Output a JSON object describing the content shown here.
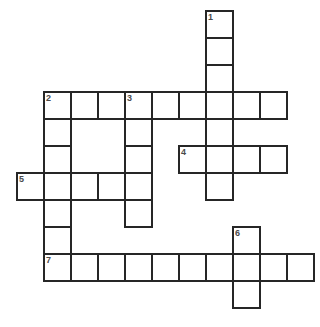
{
  "puzzle": {
    "type": "crossword-grid",
    "title": "Crossword Puzzle Grid",
    "background_color": "#ffffff",
    "cell_border_color": "#262626",
    "cell_fill_color": "#ffffff",
    "number_color": "#4a4a4a",
    "cell_size_px": 27,
    "border_width_px": 2,
    "grid_origin": {
      "x": 16,
      "y": 10
    },
    "grid_columns": 11,
    "grid_rows": 11,
    "clue_numbers_visible": [
      "1",
      "2",
      "3",
      "4",
      "5",
      "6",
      "7"
    ],
    "entries": [
      {
        "number": "1",
        "direction": "down",
        "start_col": 7,
        "start_row": 0,
        "length": 7
      },
      {
        "number": "2",
        "direction": "across",
        "start_col": 1,
        "start_row": 3,
        "length": 9
      },
      {
        "number": "2",
        "direction": "down",
        "start_col": 1,
        "start_row": 3,
        "length": 7
      },
      {
        "number": "3",
        "direction": "down",
        "start_col": 4,
        "start_row": 3,
        "length": 5
      },
      {
        "number": "4",
        "direction": "across",
        "start_col": 6,
        "start_row": 5,
        "length": 4
      },
      {
        "number": "5",
        "direction": "across",
        "start_col": 0,
        "start_row": 6,
        "length": 4
      },
      {
        "number": "6",
        "direction": "down",
        "start_col": 8,
        "start_row": 8,
        "length": 3
      },
      {
        "number": "7",
        "direction": "across",
        "start_col": 1,
        "start_row": 9,
        "length": 10
      }
    ],
    "cells": [
      {
        "col": 7,
        "row": 0,
        "number": "1",
        "letter": ""
      },
      {
        "col": 7,
        "row": 1,
        "number": "",
        "letter": ""
      },
      {
        "col": 7,
        "row": 2,
        "number": "",
        "letter": ""
      },
      {
        "col": 1,
        "row": 3,
        "number": "2",
        "letter": ""
      },
      {
        "col": 2,
        "row": 3,
        "number": "",
        "letter": ""
      },
      {
        "col": 3,
        "row": 3,
        "number": "",
        "letter": ""
      },
      {
        "col": 4,
        "row": 3,
        "number": "3",
        "letter": ""
      },
      {
        "col": 5,
        "row": 3,
        "number": "",
        "letter": ""
      },
      {
        "col": 6,
        "row": 3,
        "number": "",
        "letter": ""
      },
      {
        "col": 7,
        "row": 3,
        "number": "",
        "letter": ""
      },
      {
        "col": 8,
        "row": 3,
        "number": "",
        "letter": ""
      },
      {
        "col": 9,
        "row": 3,
        "number": "",
        "letter": ""
      },
      {
        "col": 1,
        "row": 4,
        "number": "",
        "letter": ""
      },
      {
        "col": 4,
        "row": 4,
        "number": "",
        "letter": ""
      },
      {
        "col": 7,
        "row": 4,
        "number": "",
        "letter": ""
      },
      {
        "col": 1,
        "row": 5,
        "number": "",
        "letter": ""
      },
      {
        "col": 4,
        "row": 5,
        "number": "",
        "letter": ""
      },
      {
        "col": 6,
        "row": 5,
        "number": "4",
        "letter": ""
      },
      {
        "col": 7,
        "row": 5,
        "number": "",
        "letter": ""
      },
      {
        "col": 8,
        "row": 5,
        "number": "",
        "letter": ""
      },
      {
        "col": 9,
        "row": 5,
        "number": "",
        "letter": ""
      },
      {
        "col": 0,
        "row": 6,
        "number": "5",
        "letter": ""
      },
      {
        "col": 1,
        "row": 6,
        "number": "",
        "letter": ""
      },
      {
        "col": 2,
        "row": 6,
        "number": "",
        "letter": ""
      },
      {
        "col": 3,
        "row": 6,
        "number": "",
        "letter": ""
      },
      {
        "col": 4,
        "row": 6,
        "number": "",
        "letter": ""
      },
      {
        "col": 7,
        "row": 6,
        "number": "",
        "letter": ""
      },
      {
        "col": 1,
        "row": 7,
        "number": "",
        "letter": ""
      },
      {
        "col": 4,
        "row": 7,
        "number": "",
        "letter": ""
      },
      {
        "col": 1,
        "row": 8,
        "number": "",
        "letter": ""
      },
      {
        "col": 8,
        "row": 8,
        "number": "6",
        "letter": ""
      },
      {
        "col": 1,
        "row": 9,
        "number": "7",
        "letter": ""
      },
      {
        "col": 2,
        "row": 9,
        "number": "",
        "letter": ""
      },
      {
        "col": 3,
        "row": 9,
        "number": "",
        "letter": ""
      },
      {
        "col": 4,
        "row": 9,
        "number": "",
        "letter": ""
      },
      {
        "col": 5,
        "row": 9,
        "number": "",
        "letter": ""
      },
      {
        "col": 6,
        "row": 9,
        "number": "",
        "letter": ""
      },
      {
        "col": 7,
        "row": 9,
        "number": "",
        "letter": ""
      },
      {
        "col": 8,
        "row": 9,
        "number": "",
        "letter": ""
      },
      {
        "col": 9,
        "row": 9,
        "number": "",
        "letter": ""
      },
      {
        "col": 10,
        "row": 9,
        "number": "",
        "letter": ""
      },
      {
        "col": 8,
        "row": 10,
        "number": "",
        "letter": ""
      }
    ]
  }
}
